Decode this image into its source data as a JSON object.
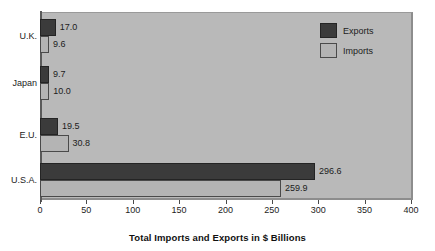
{
  "chart_data": {
    "type": "bar",
    "orientation": "horizontal",
    "title": "",
    "xlabel": "Total Imports and Exports in $ Billions",
    "ylabel": "",
    "categories": [
      "U.K.",
      "Japan",
      "E.U.",
      "U.S.A."
    ],
    "series": [
      {
        "name": "Exports",
        "color": "#3b3b3b",
        "values": [
          17.0,
          9.7,
          19.5,
          296.6
        ]
      },
      {
        "name": "Imports",
        "color": "#b4b4b4",
        "values": [
          9.6,
          10.0,
          30.8,
          259.9
        ]
      }
    ],
    "value_labels": {
      "U.K.": {
        "exports": "17.0",
        "imports": "9.6"
      },
      "Japan": {
        "exports": "9.7",
        "imports": "10.0"
      },
      "E.U.": {
        "exports": "19.5",
        "imports": "30.8"
      },
      "U.S.A.": {
        "exports": "296.6",
        "imports": "259.9"
      }
    },
    "xlim": [
      0,
      400
    ],
    "xticks": [
      0,
      50,
      100,
      150,
      200,
      250,
      300,
      350,
      400
    ],
    "xtick_labels": [
      "0",
      "50",
      "100",
      "150",
      "200",
      "250",
      "300",
      "350",
      "400"
    ],
    "grid": false,
    "legend_position": "top-right",
    "plot_background": "#b9b9b9",
    "page_background": "#ffffff"
  },
  "legend": {
    "items": [
      {
        "label": "Exports",
        "color": "#3b3b3b"
      },
      {
        "label": "Imports",
        "color": "#b4b4b4"
      }
    ]
  },
  "axis": {
    "title": "Total Imports and Exports in $ Billions"
  }
}
